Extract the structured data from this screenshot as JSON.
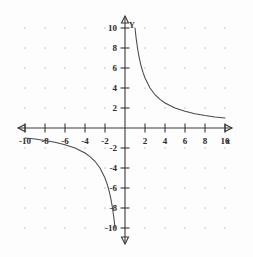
{
  "figure": {
    "background_color": "#fdfdfd",
    "axis_color": "#3a3a3a",
    "curve_color": "#4a4a4a",
    "grid_dot_color": "#c9c9c9",
    "x_axis_name": "x",
    "y_axis_name": "Y"
  },
  "chart_data": {
    "type": "line",
    "title": "",
    "subtitle": "",
    "xlabel": "x",
    "ylabel": "Y",
    "xlim": [
      -11,
      11
    ],
    "ylim": [
      -11,
      11
    ],
    "grid": "dotted grid points at even integer intersections",
    "legend": "none",
    "x_ticks": [
      -10,
      -8,
      -6,
      -4,
      -2,
      2,
      4,
      6,
      8,
      10
    ],
    "y_ticks": [
      -10,
      -8,
      -6,
      -4,
      -2,
      2,
      4,
      6,
      8,
      10
    ],
    "x_tick_labels": [
      "-10",
      "-8",
      "-6",
      "-4",
      "-2",
      "2",
      "4",
      "6",
      "8",
      "10"
    ],
    "y_tick_labels": [
      "-10",
      "-8",
      "-6",
      "-4",
      "-2",
      "2",
      "4",
      "6",
      "8",
      "10"
    ],
    "function": "y = 10 / x",
    "annotations": [
      "vertical asymptote at x = 0",
      "horizontal asymptote at y = 0"
    ],
    "series": [
      {
        "name": "branch-quadrant-I",
        "x": [
          1.0,
          1.1,
          1.25,
          1.4,
          1.6,
          1.8,
          2.0,
          2.5,
          3.0,
          3.5,
          4.0,
          5.0,
          6.0,
          7.0,
          8.0,
          9.0,
          10.0
        ],
        "y": [
          10.0,
          9.09,
          8.0,
          7.14,
          6.25,
          5.56,
          5.0,
          4.0,
          3.33,
          2.86,
          2.5,
          2.0,
          1.67,
          1.43,
          1.25,
          1.11,
          1.0
        ]
      },
      {
        "name": "branch-quadrant-III",
        "x": [
          -10.0,
          -9.0,
          -8.0,
          -7.0,
          -6.0,
          -5.0,
          -4.0,
          -3.5,
          -3.0,
          -2.5,
          -2.0,
          -1.8,
          -1.6,
          -1.4,
          -1.25,
          -1.1,
          -1.0
        ],
        "y": [
          -1.0,
          -1.11,
          -1.25,
          -1.43,
          -1.67,
          -2.0,
          -2.5,
          -2.86,
          -3.33,
          -4.0,
          -5.0,
          -5.56,
          -6.25,
          -7.14,
          -8.0,
          -9.09,
          -10.0
        ]
      }
    ]
  }
}
